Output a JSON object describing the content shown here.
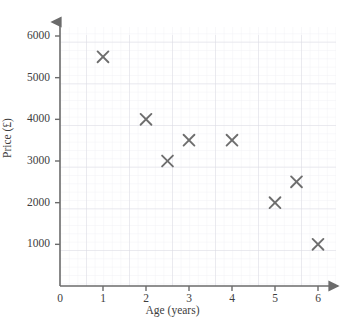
{
  "chart_data": {
    "type": "scatter",
    "title": "",
    "xlabel": "Age (years)",
    "ylabel": "Price (£)",
    "xlim": [
      0,
      6.4
    ],
    "ylim": [
      0,
      6400
    ],
    "xticks": [
      0,
      1,
      2,
      3,
      4,
      5,
      6
    ],
    "xtick_labels": [
      "0",
      "1",
      "2",
      "3",
      "4",
      "5",
      "6"
    ],
    "yticks": [
      1000,
      2000,
      3000,
      4000,
      5000,
      6000
    ],
    "ytick_labels": [
      "1000",
      "2000",
      "3000",
      "4000",
      "5000",
      "6000"
    ],
    "grid": true,
    "grid_minor_step_x": 0.2,
    "grid_minor_step_y": 200,
    "legend": "none",
    "marker": "x",
    "marker_color": "#6e6e6e",
    "points": [
      {
        "x": 1,
        "y": 5500
      },
      {
        "x": 2,
        "y": 4000
      },
      {
        "x": 2.5,
        "y": 3000
      },
      {
        "x": 3,
        "y": 3500
      },
      {
        "x": 4,
        "y": 3500
      },
      {
        "x": 5,
        "y": 2000
      },
      {
        "x": 5.5,
        "y": 2500
      },
      {
        "x": 6,
        "y": 1000
      }
    ]
  },
  "colors": {
    "axis": "#6b6b6b",
    "grid_minor": "#ececf1",
    "grid_major": "#d8d8e0",
    "marker": "#6e6e6e",
    "text": "#3d3d3d",
    "background": "#ffffff"
  },
  "axis_titles": {
    "x": "Age (years)",
    "y": "Price (£)"
  }
}
